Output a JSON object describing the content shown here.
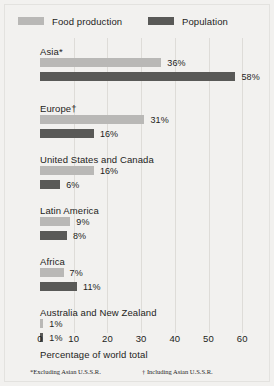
{
  "chart_data": {
    "type": "bar",
    "orientation": "horizontal",
    "title": "",
    "xlabel": "Percentage of world total",
    "ylabel": "",
    "xlim": [
      0,
      63
    ],
    "grid": true,
    "legend_position": "top",
    "xticks": [
      0,
      10,
      20,
      30,
      40,
      50,
      60
    ],
    "xtick_labels": [
      "0",
      "10",
      "20",
      "30",
      "40",
      "50",
      "60"
    ],
    "categories": [
      "Asia*",
      "Europe†",
      "United States and Canada",
      "Latin America",
      "Africa",
      "Australia and New Zealand"
    ],
    "series": [
      {
        "name": "Food production",
        "color": "#b9b8b6",
        "values": [
          36,
          31,
          16,
          9,
          7,
          1
        ],
        "value_labels": [
          "36%",
          "31%",
          "16%",
          "9%",
          "7%",
          "1%"
        ]
      },
      {
        "name": "Population",
        "color": "#595957",
        "values": [
          58,
          16,
          6,
          8,
          11,
          1
        ],
        "value_labels": [
          "58%",
          "16%",
          "6%",
          "8%",
          "11%",
          "1%"
        ]
      }
    ],
    "annotations": [
      "*Excluding Asian U.S.S.R.",
      "† Including Asian U.S.S.R."
    ]
  },
  "legend": {
    "items": [
      {
        "label": "Food production",
        "color": "#b9b8b6"
      },
      {
        "label": "Population",
        "color": "#595957"
      }
    ]
  },
  "axis": {
    "title": "Percentage of world total",
    "ticks": [
      "0",
      "10",
      "20",
      "30",
      "40",
      "50",
      "60"
    ]
  },
  "footnotes": {
    "left": "*Excluding Asian U.S.S.R.",
    "right": "† Including Asian U.S.S.R."
  },
  "groups": [
    {
      "label": "Asia*",
      "bars": [
        {
          "series": "Food production",
          "value": 36,
          "label": "36%"
        },
        {
          "series": "Population",
          "value": 58,
          "label": "58%"
        }
      ]
    },
    {
      "label": "Europe†",
      "bars": [
        {
          "series": "Food production",
          "value": 31,
          "label": "31%"
        },
        {
          "series": "Population",
          "value": 16,
          "label": "16%"
        }
      ]
    },
    {
      "label": "United States and Canada",
      "bars": [
        {
          "series": "Food production",
          "value": 16,
          "label": "16%"
        },
        {
          "series": "Population",
          "value": 6,
          "label": "6%"
        }
      ]
    },
    {
      "label": "Latin America",
      "bars": [
        {
          "series": "Food production",
          "value": 9,
          "label": "9%"
        },
        {
          "series": "Population",
          "value": 8,
          "label": "8%"
        }
      ]
    },
    {
      "label": "Africa",
      "bars": [
        {
          "series": "Food production",
          "value": 7,
          "label": "7%"
        },
        {
          "series": "Population",
          "value": 11,
          "label": "11%"
        }
      ]
    },
    {
      "label": "Australia and New Zealand",
      "bars": [
        {
          "series": "Food production",
          "value": 1,
          "label": "1%"
        },
        {
          "series": "Population",
          "value": 1,
          "label": "1%"
        }
      ]
    }
  ]
}
